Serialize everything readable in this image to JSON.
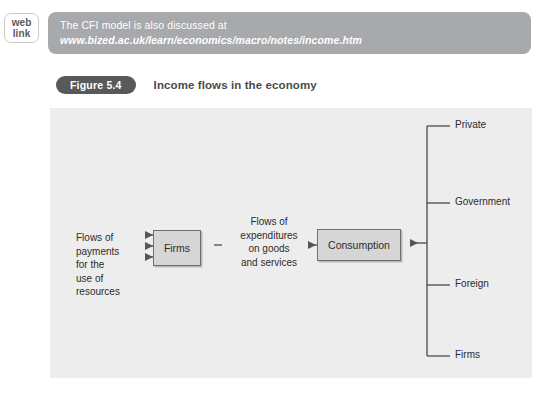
{
  "weblink": {
    "badge_line1": "web",
    "badge_line2": "link",
    "banner_text": "The CFI model is also discussed at",
    "banner_url": "www.bized.ac.uk/learn/economics/macro/notes/income.htm",
    "banner_color": "#a7a9ac",
    "banner_text_color": "#ffffff"
  },
  "figure": {
    "number": "Figure 5.4",
    "title": "Income flows in the economy",
    "pill_color": "#58595b",
    "panel_color": "#ededed"
  },
  "diagram": {
    "boxes": {
      "firms": "Firms",
      "consumption": "Consumption"
    },
    "labels": {
      "left_flow": "Flows of\npayments\nfor the\nuse of\nresources",
      "middle_flow": "Flows of\nexpenditures\non goods\nand services"
    },
    "branches": [
      {
        "label": "Private"
      },
      {
        "label": "Government"
      },
      {
        "label": "Foreign"
      },
      {
        "label": "Firms"
      }
    ],
    "box_fill": "#d6d6d6",
    "box_stroke": "#6f6f6f",
    "line_color": "#555555"
  }
}
